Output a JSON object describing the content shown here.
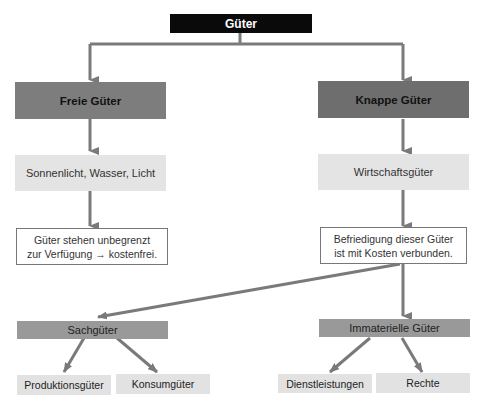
{
  "diagram": {
    "root": "Güter",
    "level1": {
      "left": "Freie Güter",
      "right": "Knappe Güter"
    },
    "level2": {
      "left": "Sonnenlicht, Wasser, Licht",
      "right": "Wirtschaftsgüter"
    },
    "level3": {
      "left_line1": "Güter stehen unbegrenzt",
      "left_line2": "zur Verfügung → kostenfrei.",
      "right_line1": "Befriedigung dieser Güter",
      "right_line2": "ist mit Kosten verbunden."
    },
    "level4": {
      "left": "Sachgüter",
      "right": "Immaterielle Güter"
    },
    "level5": {
      "sach_left": "Produktionsgüter",
      "sach_right": "Konsumgüter",
      "imm_left": "Dienstleistungen",
      "imm_right": "Rechte"
    },
    "colors": {
      "root_bg": "#0a0a0a",
      "level1_bg": "#7d7d7d",
      "level2_bg": "#e4e4e4",
      "level4_bg": "#999999",
      "level5_bg": "#e2e2e2",
      "connector": "#7a7a7a"
    }
  }
}
